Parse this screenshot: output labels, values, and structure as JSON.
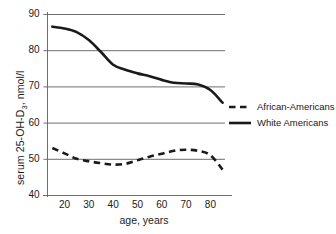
{
  "chart_data": {
    "type": "line",
    "title": "",
    "xlabel": "age, years",
    "ylabel": "serum 25-OH-D3, nmol/l",
    "ylabel_main": "serum 25-OH-D",
    "ylabel_sub": "3",
    "ylabel_tail": ", nmol/l",
    "xlim": [
      13,
      86
    ],
    "ylim": [
      40,
      90
    ],
    "xticks": [
      20,
      30,
      40,
      50,
      60,
      70,
      80
    ],
    "yticks": [
      40,
      50,
      60,
      70,
      80,
      90
    ],
    "grid": "horizontal",
    "legend_position": "right-middle",
    "series": [
      {
        "name": "African-Americans",
        "style": "dashed",
        "color": "#1a1a1a",
        "x": [
          15,
          20,
          25,
          30,
          35,
          40,
          45,
          50,
          55,
          60,
          65,
          70,
          75,
          80,
          85
        ],
        "values": [
          53.0,
          51.5,
          50.0,
          49.3,
          48.8,
          48.4,
          48.6,
          49.6,
          50.6,
          51.4,
          52.2,
          52.5,
          52.2,
          51.0,
          47.0
        ]
      },
      {
        "name": "White Americans",
        "style": "solid",
        "color": "#1a1a1a",
        "x": [
          15,
          20,
          25,
          30,
          35,
          40,
          45,
          50,
          55,
          60,
          65,
          70,
          75,
          80,
          85
        ],
        "values": [
          86.5,
          86.0,
          85.0,
          82.8,
          79.5,
          76.0,
          74.6,
          73.6,
          72.8,
          71.8,
          71.0,
          70.8,
          70.5,
          69.0,
          65.5
        ]
      }
    ]
  },
  "legend": {
    "items": [
      {
        "label": "African-Americans",
        "style": "dashed"
      },
      {
        "label": "White Americans",
        "style": "solid"
      }
    ]
  }
}
